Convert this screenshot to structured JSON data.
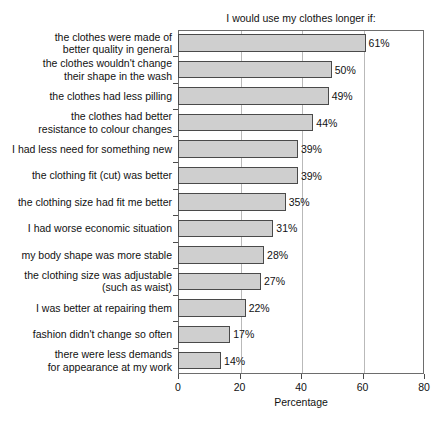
{
  "chart_data": {
    "type": "bar",
    "orientation": "horizontal",
    "title": "I would use my clothes longer if:",
    "xlabel": "Percentage",
    "ylabel": "",
    "xlim": [
      0,
      80
    ],
    "xticks": [
      0,
      20,
      40,
      60,
      80
    ],
    "xtick_labels": [
      "0",
      "20",
      "40",
      "60",
      "80"
    ],
    "grid": "vertical",
    "legend": "none",
    "bar_fill_color": "#cfcfcf",
    "bar_edge_color": "#4a4a4a",
    "categories": [
      "the clothes were made of better quality in general",
      "the clothes wouldn't change their shape in the wash",
      "the clothes had less pilling",
      "the clothes had better resistance to colour changes",
      "I had less need for something new",
      "the clothing fit (cut) was better",
      "the clothing size had fit me better",
      "I had worse economic situation",
      "my body shape was more stable",
      "the clothing size was adjustable (such as waist)",
      "I was better at repairing them",
      "fashion didn't change so often",
      "there were less demands for appearance at my work"
    ],
    "category_lines": [
      [
        "the clothes were made of",
        "better quality in general"
      ],
      [
        "the clothes wouldn't change",
        "their shape in the wash"
      ],
      [
        "the clothes had less pilling"
      ],
      [
        "the clothes had better",
        "resistance to colour changes"
      ],
      [
        "I had less need for something new"
      ],
      [
        "the clothing fit (cut) was better"
      ],
      [
        "the clothing size had fit me better"
      ],
      [
        "I had worse economic situation"
      ],
      [
        "my body shape was more stable"
      ],
      [
        "the clothing size was adjustable",
        "(such as waist)"
      ],
      [
        "I was better at repairing them"
      ],
      [
        "fashion didn't change so often"
      ],
      [
        "there were less demands",
        "for appearance at my work"
      ]
    ],
    "values": [
      61,
      50,
      49,
      44,
      39,
      39,
      35,
      31,
      28,
      27,
      22,
      17,
      14
    ],
    "value_labels": [
      "61%",
      "50%",
      "49%",
      "44%",
      "39%",
      "39%",
      "35%",
      "31%",
      "28%",
      "27%",
      "22%",
      "17%",
      "14%"
    ]
  }
}
